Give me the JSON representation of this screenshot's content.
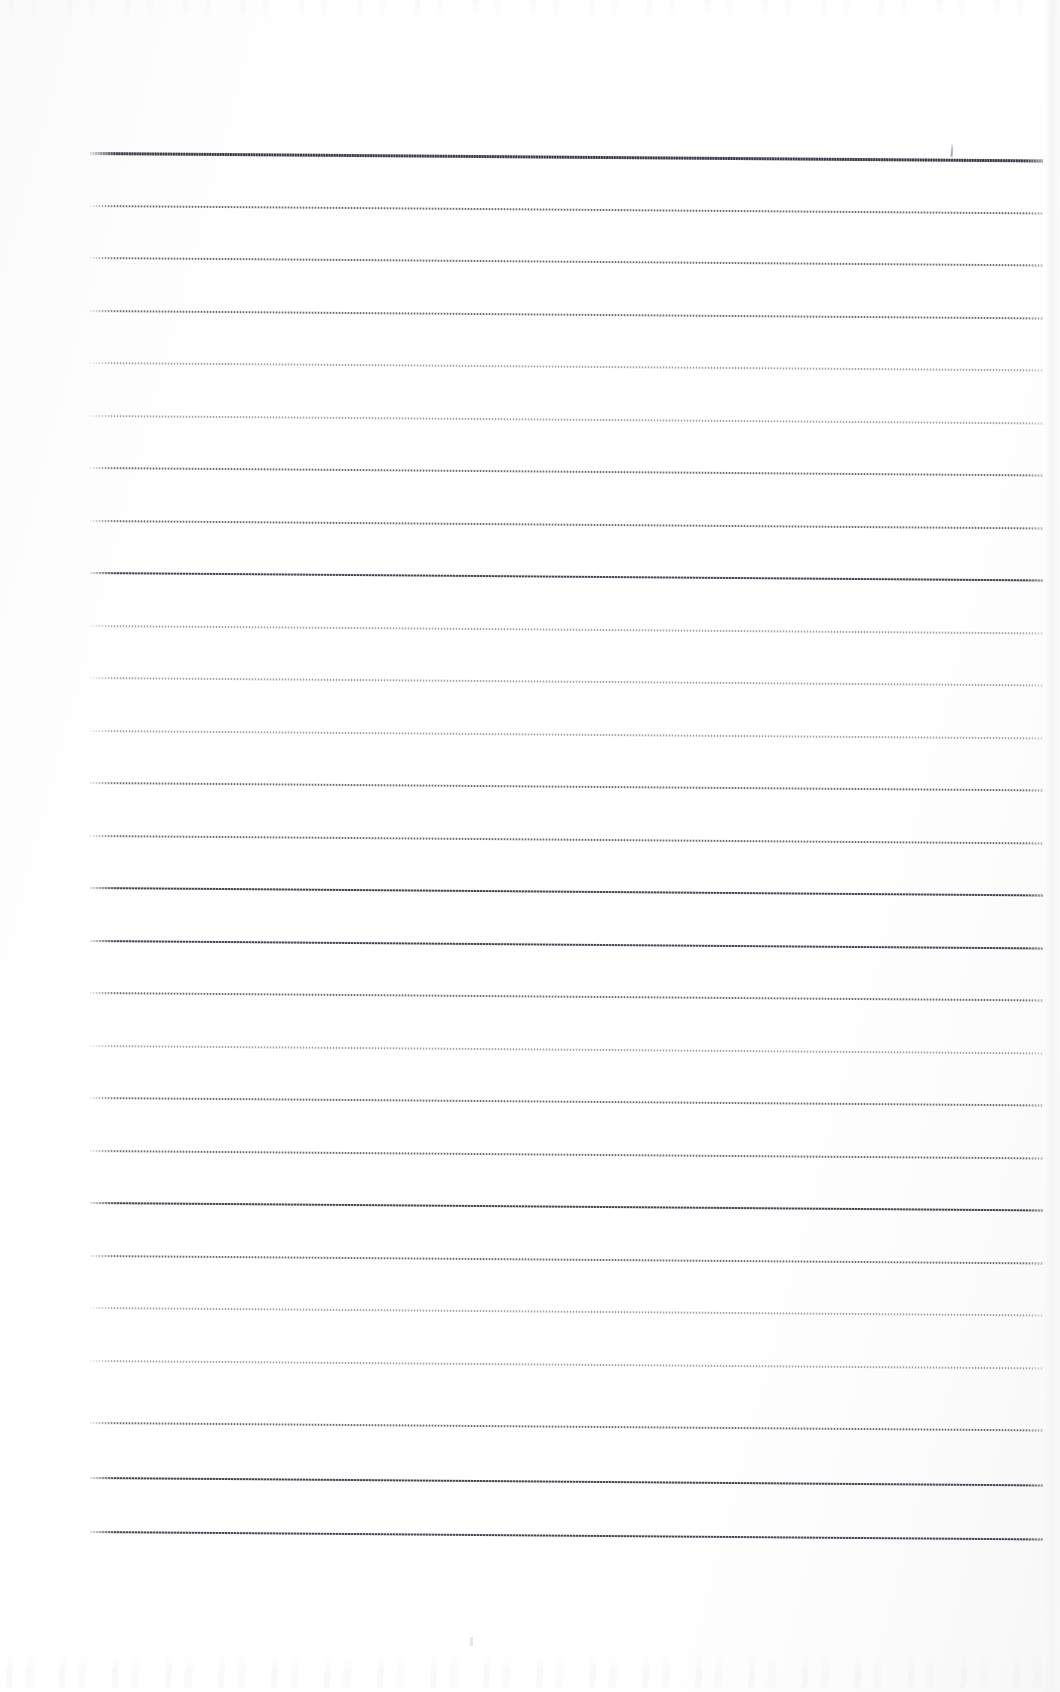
{
  "document": {
    "kind": "scanned-ruled-paper",
    "title": "Blank ruled notebook page (scan)",
    "page_width": 1060,
    "page_height": 1692,
    "background_color": "#fefefe",
    "has_written_content": false,
    "body_text": ""
  },
  "paper": {
    "rule_color": "#5f626c",
    "rule_color_light": "#8487 91",
    "rule_count": 27,
    "rule_spacing_px": 52.6,
    "first_rule_top_px": 152,
    "last_rule_top_px": 1531,
    "rule_left_px": 90,
    "rule_right_px": 1043,
    "rule_length_px": 953,
    "rule_slope_deg": 0.45,
    "left_margin_px": 90,
    "right_margin_px": 17,
    "top_margin_px": 152,
    "bottom_margin_px": 161,
    "margin_rule_present": false
  },
  "marks": {
    "pencil_tick": {
      "label": "stray pencil tick",
      "x_px": 951,
      "y_px": 143,
      "height_px": 14
    },
    "dust_speck": {
      "label": "scan dust speck",
      "x_px": 470,
      "y_px": 1637
    }
  },
  "scan_artifacts": {
    "top_bleed": "faint ink bleed-through band along the top edge",
    "bottom_bleed": "faint ink bleed-through band along the bottom edge",
    "right_edge": "subtle grey platen edge at the right margin",
    "vignette": "slight tonal gradient across the sheet"
  },
  "rules": [
    {
      "index": 1,
      "top": 152,
      "weight": "top"
    },
    {
      "index": 2,
      "top": 205,
      "weight": "normal"
    },
    {
      "index": 3,
      "top": 257,
      "weight": "normal"
    },
    {
      "index": 4,
      "top": 310,
      "weight": "normal"
    },
    {
      "index": 5,
      "top": 362,
      "weight": "light"
    },
    {
      "index": 6,
      "top": 415,
      "weight": "light"
    },
    {
      "index": 7,
      "top": 467,
      "weight": "normal"
    },
    {
      "index": 8,
      "top": 520,
      "weight": "normal"
    },
    {
      "index": 9,
      "top": 572,
      "weight": "heavy"
    },
    {
      "index": 10,
      "top": 625,
      "weight": "light"
    },
    {
      "index": 11,
      "top": 677,
      "weight": "light"
    },
    {
      "index": 12,
      "top": 730,
      "weight": "light"
    },
    {
      "index": 13,
      "top": 782,
      "weight": "normal"
    },
    {
      "index": 14,
      "top": 835,
      "weight": "normal"
    },
    {
      "index": 15,
      "top": 887,
      "weight": "heavy"
    },
    {
      "index": 16,
      "top": 940,
      "weight": "heavy"
    },
    {
      "index": 17,
      "top": 992,
      "weight": "normal"
    },
    {
      "index": 18,
      "top": 1045,
      "weight": "light"
    },
    {
      "index": 19,
      "top": 1097,
      "weight": "normal"
    },
    {
      "index": 20,
      "top": 1150,
      "weight": "normal"
    },
    {
      "index": 21,
      "top": 1202,
      "weight": "heavy"
    },
    {
      "index": 22,
      "top": 1255,
      "weight": "normal"
    },
    {
      "index": 23,
      "top": 1307,
      "weight": "light"
    },
    {
      "index": 24,
      "top": 1360,
      "weight": "light"
    },
    {
      "index": 25,
      "top": 1422,
      "weight": "normal"
    },
    {
      "index": 26,
      "top": 1477,
      "weight": "heavy"
    },
    {
      "index": 27,
      "top": 1531,
      "weight": "heavy"
    }
  ]
}
